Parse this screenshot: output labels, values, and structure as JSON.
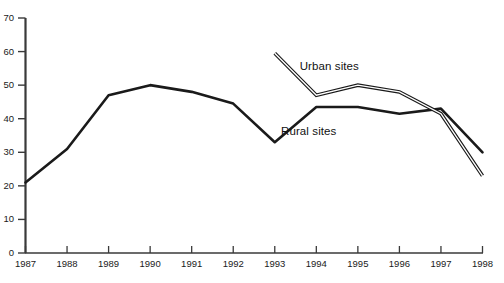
{
  "chart_data": {
    "type": "line",
    "title": "",
    "subtitle": "",
    "xlabel": "",
    "ylabel": "",
    "x": [
      1987,
      1988,
      1989,
      1990,
      1991,
      1992,
      1993,
      1994,
      1995,
      1996,
      1997,
      1998
    ],
    "xticklabels": [
      "1987",
      "1988",
      "1989",
      "1990",
      "1991",
      "1992",
      "1993",
      "1994",
      "1995",
      "1996",
      "1997",
      "1998"
    ],
    "yticklabels": [
      "0",
      "10",
      "20",
      "30",
      "40",
      "50",
      "60",
      "70"
    ],
    "yticks": [
      0,
      10,
      20,
      30,
      40,
      50,
      60,
      70
    ],
    "ylim": [
      0,
      70
    ],
    "xlim": [
      1987,
      1998
    ],
    "grid": false,
    "legend_position": "inline-annotation",
    "series": [
      {
        "name": "Rural sites",
        "style": "solid-thick",
        "color": "#1a1a1a",
        "x": [
          1987,
          1988,
          1989,
          1990,
          1991,
          1992,
          1993,
          1994,
          1995,
          1996,
          1997,
          1998
        ],
        "values": [
          21,
          31,
          47,
          50,
          48,
          44.5,
          33,
          43.5,
          43.5,
          41.5,
          43,
          30
        ]
      },
      {
        "name": "Urban sites",
        "style": "double-outline",
        "color": "#1a1a1a",
        "x": [
          1993,
          1994,
          1995,
          1996,
          1997,
          1998
        ],
        "values": [
          59.5,
          47,
          50,
          48,
          41.5,
          23
        ]
      }
    ],
    "annotations": [
      {
        "text": "Urban sites",
        "x": 1993.6,
        "y": 55.5
      },
      {
        "text": "Rural sites",
        "x": 1993.15,
        "y": 36
      }
    ]
  }
}
